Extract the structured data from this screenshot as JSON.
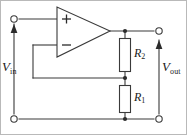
{
  "figure": {
    "border_color": "#b9b9b9",
    "wire_color": "#3a3a3a",
    "component_fill": "#ffffff"
  },
  "labels": {
    "vin": {
      "symbol": "V",
      "subscript": "in"
    },
    "vout": {
      "symbol": "V",
      "subscript": "out"
    },
    "r2": {
      "symbol": "R",
      "subscript": "2"
    },
    "r1": {
      "symbol": "R",
      "subscript": "1"
    }
  },
  "opamp": {
    "plus_sign": "+",
    "minus_sign": "−"
  },
  "terminals": [
    {
      "name": "input-positive-terminal",
      "x": 14,
      "y": 19
    },
    {
      "name": "input-negative-terminal",
      "x": 14,
      "y": 119
    },
    {
      "name": "output-positive-terminal",
      "x": 159,
      "y": 31
    },
    {
      "name": "output-negative-terminal",
      "x": 159,
      "y": 119
    }
  ],
  "nodes": [
    {
      "name": "output-node",
      "x": 125,
      "y": 31
    },
    {
      "name": "divider-midpoint-node",
      "x": 125,
      "y": 78
    },
    {
      "name": "ground-node",
      "x": 125,
      "y": 119
    }
  ]
}
